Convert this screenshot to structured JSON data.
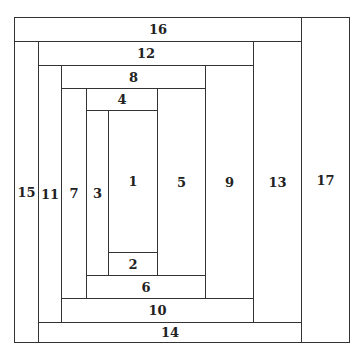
{
  "diagram": {
    "cells": [
      {
        "label": "16",
        "x": 14,
        "y": 17,
        "w": 288,
        "h": 25
      },
      {
        "label": "17",
        "x": 301,
        "y": 17,
        "w": 49,
        "h": 326
      },
      {
        "label": "15",
        "x": 14,
        "y": 41,
        "w": 25,
        "h": 302
      },
      {
        "label": "12",
        "x": 38,
        "y": 41,
        "w": 216,
        "h": 25
      },
      {
        "label": "13",
        "x": 253,
        "y": 41,
        "w": 49,
        "h": 282
      },
      {
        "label": "14",
        "x": 38,
        "y": 322,
        "w": 264,
        "h": 21
      },
      {
        "label": "11",
        "x": 38,
        "y": 65,
        "w": 24,
        "h": 258
      },
      {
        "label": "8",
        "x": 61,
        "y": 65,
        "w": 145,
        "h": 24
      },
      {
        "label": "9",
        "x": 205,
        "y": 65,
        "w": 49,
        "h": 234
      },
      {
        "label": "10",
        "x": 61,
        "y": 298,
        "w": 193,
        "h": 25
      },
      {
        "label": "7",
        "x": 61,
        "y": 88,
        "w": 26,
        "h": 211
      },
      {
        "label": "4",
        "x": 86,
        "y": 88,
        "w": 72,
        "h": 23
      },
      {
        "label": "5",
        "x": 157,
        "y": 88,
        "w": 49,
        "h": 188
      },
      {
        "label": "6",
        "x": 86,
        "y": 275,
        "w": 120,
        "h": 24
      },
      {
        "label": "3",
        "x": 86,
        "y": 110,
        "w": 23,
        "h": 166
      },
      {
        "label": "1",
        "x": 108,
        "y": 110,
        "w": 50,
        "h": 143
      },
      {
        "label": "2",
        "x": 108,
        "y": 252,
        "w": 50,
        "h": 24
      }
    ]
  }
}
